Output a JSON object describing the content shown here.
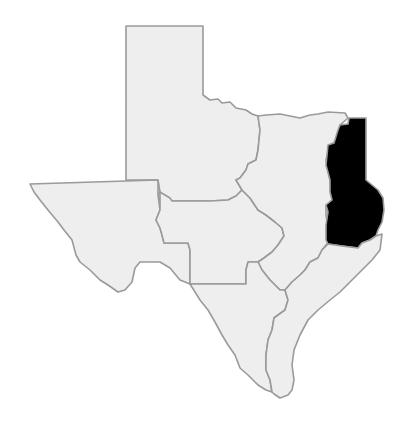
{
  "map": {
    "subject": "Texas regions",
    "colors": {
      "background": "#ffffff",
      "region_fill": "#eeeeee",
      "border": "#9a9a9a",
      "highlight": "#000000"
    },
    "regions": [
      {
        "id": "panhandle",
        "highlighted": false
      },
      {
        "id": "west",
        "highlighted": false
      },
      {
        "id": "central",
        "highlighted": false
      },
      {
        "id": "north-central",
        "highlighted": false
      },
      {
        "id": "east",
        "highlighted": true
      },
      {
        "id": "south",
        "highlighted": false
      },
      {
        "id": "gulf-coast",
        "highlighted": false
      }
    ]
  }
}
